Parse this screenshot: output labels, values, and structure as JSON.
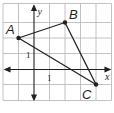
{
  "diagram": {
    "type": "coordinate-plane-triangle",
    "grid": {
      "x_min": -2,
      "x_max": 5,
      "y_min": -2,
      "y_max": 4,
      "origin_px": [
        34,
        69
      ],
      "unit_px": 15.5,
      "grid_color": "#b3b3b3",
      "axis_color": "#231f20"
    },
    "axes": {
      "x_label": "x",
      "y_label": "y",
      "x_tick_label": "1",
      "y_tick_label": "1"
    },
    "points": [
      {
        "name": "A",
        "x": -1,
        "y": 2
      },
      {
        "name": "B",
        "x": 2,
        "y": 3
      },
      {
        "name": "C",
        "x": 4,
        "y": -1
      }
    ],
    "segments": [
      [
        "A",
        "B"
      ],
      [
        "B",
        "C"
      ],
      [
        "C",
        "A"
      ]
    ],
    "line_color": "#231f20"
  }
}
